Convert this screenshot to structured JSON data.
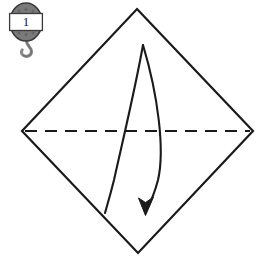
{
  "diagram": {
    "background_color": "#ffffff",
    "line_color": "#1a1a1a",
    "step_badge": {
      "icon_name": "hanging-tag-hook-icon",
      "number": "1",
      "body_color": "#777777",
      "band_color": "#ffffff",
      "outline_color": "#3a3a3a",
      "hook_color": "#888888"
    },
    "shape": {
      "name": "square-rotated-45",
      "label": "paper-square",
      "stroke_color": "#1a1a1a",
      "stroke_width": 2,
      "vertices": {
        "top": [
          137,
          9
        ],
        "right": [
          253,
          131
        ],
        "bottom": [
          138,
          253
        ],
        "left": [
          22,
          131
        ]
      }
    },
    "fold_line": {
      "name": "valley-fold-line",
      "style": "dashed",
      "dash_pattern": "12 8",
      "stroke_color": "#1a1a1a",
      "stroke_width": 2,
      "from": [
        24,
        131
      ],
      "to": [
        251,
        131
      ]
    },
    "fold_arrow": {
      "name": "fold-direction-arrow",
      "direction": "down",
      "stroke_color": "#1a1a1a",
      "stroke_width": 2,
      "tip": [
        145,
        214
      ],
      "origin": [
        143,
        45
      ],
      "tail_end": [
        105,
        213
      ]
    }
  }
}
